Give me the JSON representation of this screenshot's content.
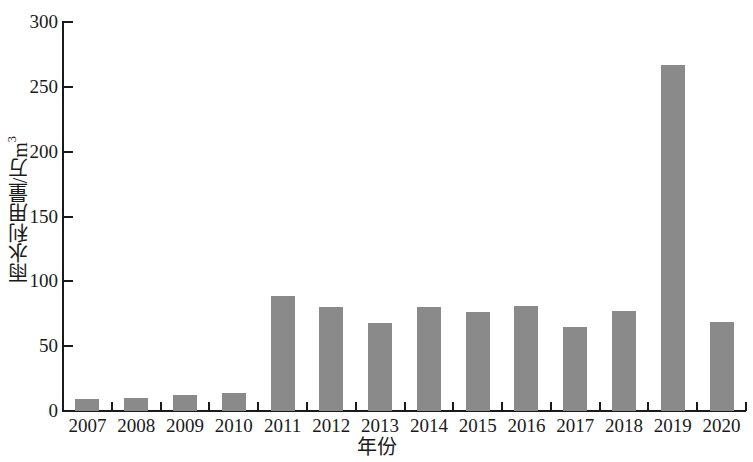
{
  "chart_data": {
    "type": "bar",
    "title": "",
    "xlabel": "年份",
    "ylabel": "雨水利用量/万m³",
    "ylabel_main": "雨水利用量/万m",
    "ylabel_sup": "3",
    "categories": [
      "2007",
      "2008",
      "2009",
      "2010",
      "2011",
      "2012",
      "2013",
      "2014",
      "2015",
      "2016",
      "2017",
      "2018",
      "2019",
      "2020"
    ],
    "values": [
      9,
      10,
      12,
      14,
      89,
      80,
      68,
      80,
      76,
      81,
      65,
      77,
      267,
      69
    ],
    "ylim": [
      0,
      300
    ],
    "yticks": [
      0,
      50,
      100,
      150,
      200,
      250,
      300
    ],
    "ytick_labels": [
      "0",
      "50",
      "100",
      "150",
      "200",
      "250",
      "300"
    ],
    "grid": false,
    "legend": null,
    "bar_color": "#8a8a8a",
    "axis_color": "#1a1a1a",
    "background": "#ffffff"
  }
}
